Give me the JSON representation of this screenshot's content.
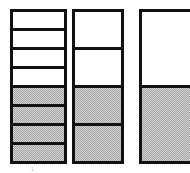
{
  "figure": {
    "background_color": "#ffffff",
    "outline_color": "#111111",
    "fill_color": "#d3d3d3",
    "empty_color": "#ffffff",
    "caption": "1"
  },
  "bars": [
    {
      "name": "bar-eighths",
      "total_segments": 8,
      "filled_segments": 4,
      "fraction_label": "4/8",
      "left": 10,
      "top": 9,
      "width": 57,
      "height": 155,
      "segments": [
        {
          "filled": false
        },
        {
          "filled": false
        },
        {
          "filled": false
        },
        {
          "filled": false
        },
        {
          "filled": true
        },
        {
          "filled": true
        },
        {
          "filled": true
        },
        {
          "filled": true
        }
      ]
    },
    {
      "name": "bar-fourths",
      "total_segments": 4,
      "filled_segments": 2,
      "fraction_label": "2/4",
      "left": 72,
      "top": 9,
      "width": 52,
      "height": 155,
      "segments": [
        {
          "filled": false
        },
        {
          "filled": false
        },
        {
          "filled": true
        },
        {
          "filled": true
        }
      ]
    },
    {
      "name": "bar-halves",
      "total_segments": 2,
      "filled_segments": 1,
      "fraction_label": "1/2",
      "left": 139,
      "top": 9,
      "width": 60,
      "height": 155,
      "segments": [
        {
          "filled": false
        },
        {
          "filled": true
        }
      ]
    }
  ],
  "caption": {
    "text": "1",
    "left": 31,
    "top": 167
  }
}
